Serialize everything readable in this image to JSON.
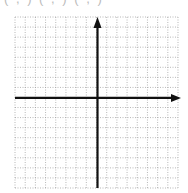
{
  "top_label": "( , )  ( , )  ( , )",
  "graph": {
    "type": "coordinate-grid",
    "grid": {
      "left": 15,
      "top": 17,
      "right": 178,
      "bottom": 188,
      "cols": 16,
      "rows": 17
    },
    "x_axis": {
      "y_row": 8,
      "arrow": "right"
    },
    "y_axis": {
      "x_col": 8,
      "arrow": "up"
    },
    "grid_color": "#9a9a9a",
    "axis_color": "#111111"
  }
}
